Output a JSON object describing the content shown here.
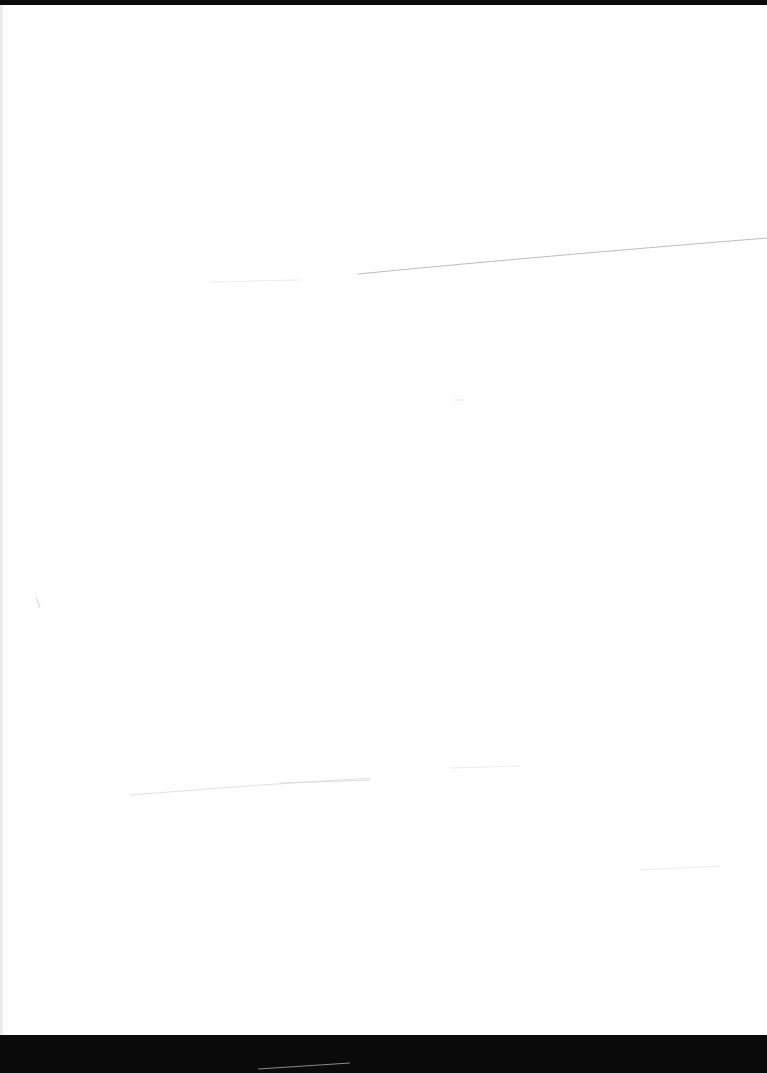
{
  "document": {
    "type": "scanned-page",
    "content": "",
    "colors": {
      "paper": "#fefefe",
      "scan_border": "#0a0a0a",
      "artifact_line": "#c8c8c8"
    }
  }
}
